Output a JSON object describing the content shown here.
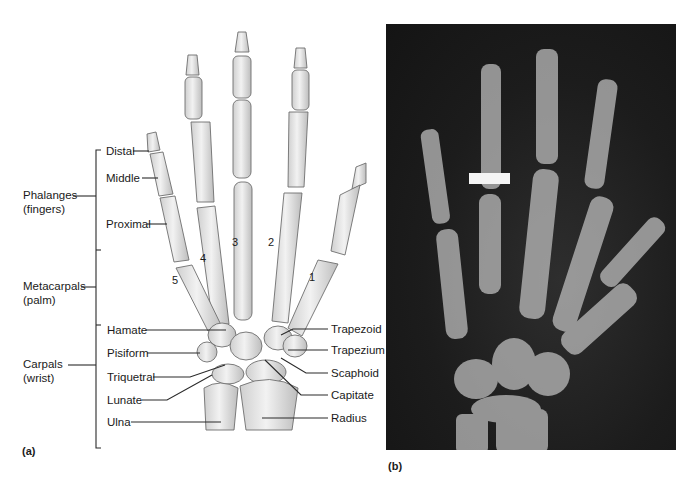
{
  "figure": {
    "panel_a": {
      "tag": "(a)",
      "groups": [
        {
          "name": "Phalanges",
          "sub": "(fingers)"
        },
        {
          "name": "Metacarpals",
          "sub": "(palm)"
        },
        {
          "name": "Carpals",
          "sub": "(wrist)"
        }
      ],
      "phalanx_labels": [
        "Distal",
        "Middle",
        "Proximal"
      ],
      "left_labels": [
        "Hamate",
        "Pisiform",
        "Triquetral",
        "Lunate",
        "Ulna"
      ],
      "right_labels": [
        "Trapezoid",
        "Trapezium",
        "Scaphoid",
        "Capitate",
        "Radius"
      ],
      "digit_numbers": [
        "1",
        "2",
        "3",
        "4",
        "5"
      ]
    },
    "panel_b": {
      "tag": "(b)",
      "description": "X-ray radiograph of the hand",
      "background_color": "#1a1a1a",
      "scale_bar_color": "#f4f4f4"
    }
  }
}
